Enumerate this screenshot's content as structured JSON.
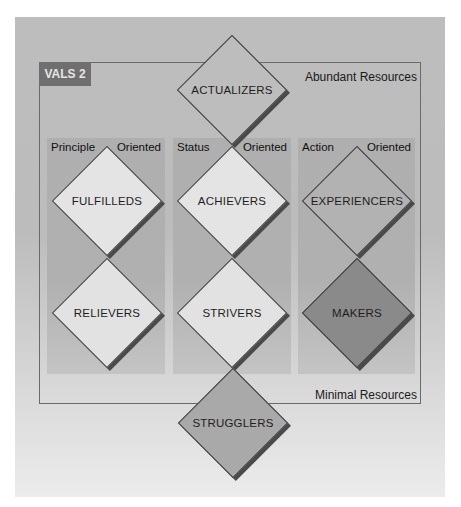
{
  "diagram": {
    "title_badge": "VALS 2",
    "top_label": "Abundant Resources",
    "bottom_label": "Minimal Resources",
    "colors": {
      "outer_background": "#bdbdbd",
      "column_background": "#b0b0b0",
      "badge_background": "#6f6f6f",
      "light_diamond": "#e4e4e4",
      "mid_diamond": "#a9a9a9",
      "dark_diamond": "#8a8a8a",
      "shadow": "#4a4a4a"
    },
    "columns": [
      {
        "left": "Principle",
        "right": "Oriented"
      },
      {
        "left": "Status",
        "right": "Oriented"
      },
      {
        "left": "Action",
        "right": "Oriented"
      }
    ],
    "segments": {
      "actualizers": "ACTUALIZERS",
      "fulfilleds": "FULFILLEDS",
      "achievers": "ACHIEVERS",
      "experiencers": "EXPERIENCERS",
      "believers": "RELIEVERS",
      "strivers": "STRIVERS",
      "makers": "MAKERS",
      "strugglers": "STRUGGLERS"
    }
  }
}
